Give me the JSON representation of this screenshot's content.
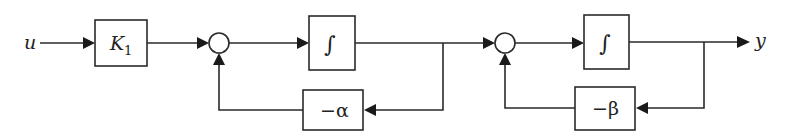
{
  "diagram": {
    "type": "block-diagram",
    "input_label": "u",
    "output_label": "y",
    "blocks": [
      {
        "id": "gain",
        "label": "K",
        "subscript": "1"
      },
      {
        "id": "integrator1",
        "label": "∫"
      },
      {
        "id": "feedback1",
        "label": "−α"
      },
      {
        "id": "integrator2",
        "label": "∫"
      },
      {
        "id": "feedback2",
        "label": "−β"
      }
    ],
    "summing_junctions": [
      {
        "id": "sum1"
      },
      {
        "id": "sum2"
      }
    ],
    "connections": [
      {
        "from": "u",
        "to": "gain"
      },
      {
        "from": "gain",
        "to": "sum1"
      },
      {
        "from": "sum1",
        "to": "integrator1"
      },
      {
        "from": "integrator1",
        "to": "sum2"
      },
      {
        "from": "integrator1",
        "to": "feedback1"
      },
      {
        "from": "feedback1",
        "to": "sum1"
      },
      {
        "from": "sum2",
        "to": "integrator2"
      },
      {
        "from": "integrator2",
        "to": "y"
      },
      {
        "from": "integrator2",
        "to": "feedback2"
      },
      {
        "from": "feedback2",
        "to": "sum2"
      }
    ],
    "colors": {
      "line": "#2a2a2a",
      "background": "#ffffff"
    }
  }
}
